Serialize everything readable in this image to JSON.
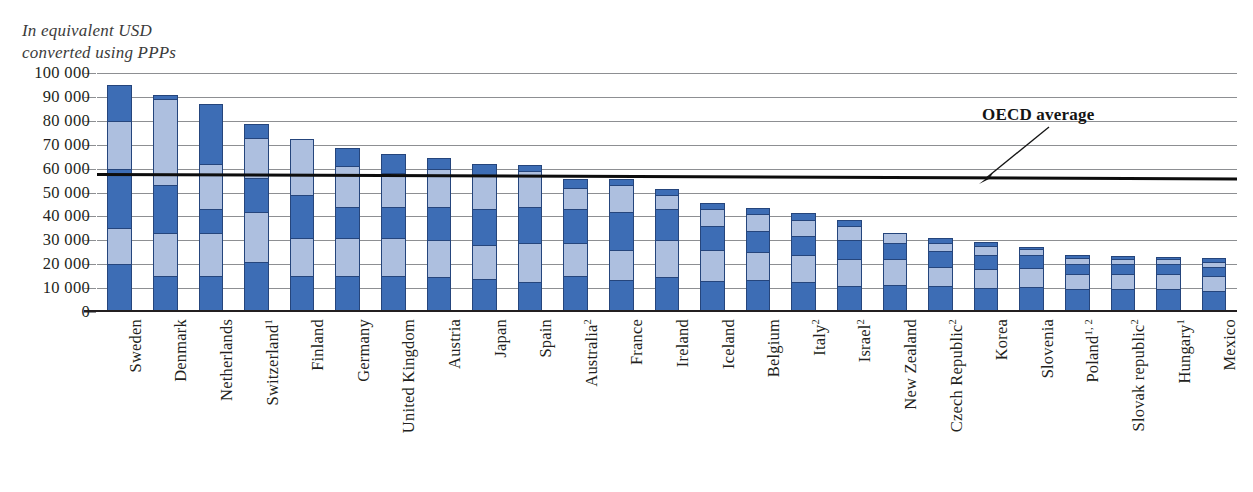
{
  "caption": "In equivalent USD\nconverted using PPPs",
  "annotation": {
    "oecd_label": "OECD average",
    "oecd_value": 58000
  },
  "axis": {
    "y_ticks": [
      "100 000",
      "90 000",
      "80 000",
      "70 000",
      "60 000",
      "50 000",
      "40 000",
      "30 000",
      "20 000",
      "10 000",
      "0"
    ]
  },
  "colors": {
    "dark_blue": "#3d6db5",
    "light_blue": "#adbfdf",
    "outline": "#25457c",
    "gridline": "#8d8f92",
    "axis": "#231f20",
    "oecd_line": "#0d0d0d"
  },
  "chart_data": {
    "type": "bar",
    "title": "In equivalent USD converted using PPPs",
    "xlabel": "",
    "ylabel": "",
    "ylim": [
      0,
      100000
    ],
    "ytick_step": 10000,
    "grid": true,
    "legend": false,
    "stacked": true,
    "segment_note": "Each bar is divided into alternating dark/light blue bands marking successive salary-scale steps.",
    "annotations": [
      {
        "text": "OECD average",
        "value": 58000,
        "type": "horizontal-line"
      }
    ],
    "categories": [
      "Sweden",
      "Denmark",
      "Netherlands",
      "Switzerland",
      "Finland",
      "Germany",
      "United Kingdom",
      "Austria",
      "Japan",
      "Spain",
      "Australia",
      "France",
      "Ireland",
      "Iceland",
      "Belgium",
      "Italy",
      "Israel",
      "New Zealand",
      "Czech Republic",
      "Korea",
      "Slovenia",
      "Poland",
      "Slovak republic",
      "Hungary",
      "Mexico"
    ],
    "category_footnotes": [
      "",
      "",
      "",
      "1",
      "",
      "",
      "",
      "",
      "",
      "",
      "2",
      "",
      "",
      "",
      "",
      "2",
      "2",
      "",
      "2",
      "",
      "",
      "1, 2",
      "2",
      "1",
      ""
    ],
    "values": [
      95000,
      91000,
      87000,
      78500,
      72500,
      68500,
      66000,
      64500,
      62000,
      61500,
      55500,
      55500,
      51500,
      45500,
      43500,
      41500,
      38500,
      33000,
      31000,
      29500,
      27000,
      23800,
      23300,
      23200,
      22500
    ],
    "band_boundaries": [
      [
        0,
        20000,
        35000,
        60000,
        80000,
        95000
      ],
      [
        0,
        15000,
        33000,
        53000,
        89000,
        91000
      ],
      [
        0,
        15000,
        33000,
        43000,
        62000,
        87000
      ],
      [
        0,
        21000,
        42000,
        56000,
        73000,
        78500
      ],
      [
        0,
        15000,
        31000,
        49000,
        72500
      ],
      [
        0,
        15000,
        31000,
        44000,
        61000,
        68500
      ],
      [
        0,
        15000,
        31000,
        44000,
        58000,
        66000
      ],
      [
        0,
        14500,
        30000,
        44000,
        60000,
        64500
      ],
      [
        0,
        14000,
        28000,
        43000,
        57000,
        62000
      ],
      [
        0,
        12500,
        29000,
        44000,
        59000,
        61500
      ],
      [
        0,
        15000,
        29000,
        43000,
        52000,
        55500
      ],
      [
        0,
        13500,
        26000,
        42000,
        53000,
        55500
      ],
      [
        0,
        14500,
        30000,
        43000,
        49000,
        51500
      ],
      [
        0,
        13000,
        26000,
        36000,
        43000,
        45500
      ],
      [
        0,
        13500,
        25000,
        34000,
        41000,
        43500
      ],
      [
        0,
        12500,
        24000,
        32000,
        38500,
        41500
      ],
      [
        0,
        11000,
        22000,
        30000,
        36000,
        38500
      ],
      [
        0,
        11500,
        22000,
        29000,
        33000
      ],
      [
        0,
        11000,
        19000,
        25500,
        29000,
        31000
      ],
      [
        0,
        10000,
        18000,
        24000,
        27500,
        29500
      ],
      [
        0,
        10500,
        18500,
        24000,
        26500,
        27000
      ],
      [
        0,
        9500,
        16000,
        20000,
        22500,
        23800
      ],
      [
        0,
        9500,
        16000,
        20000,
        22000,
        23300
      ],
      [
        0,
        9500,
        16000,
        20000,
        22000,
        23200
      ],
      [
        0,
        9000,
        15000,
        19000,
        21000,
        22500
      ]
    ]
  }
}
